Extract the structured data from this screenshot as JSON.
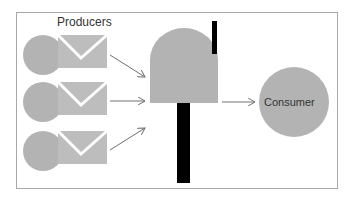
{
  "title": "Producers",
  "consumer": {
    "label": "Consumer"
  },
  "producers": [
    {
      "name": "producer-1"
    },
    {
      "name": "producer-2"
    },
    {
      "name": "producer-3"
    }
  ],
  "colors": {
    "shape_fill": "#b3b3b3",
    "envelope_fill": "#bdbdbd",
    "mailbox_post": "#000000",
    "arrow": "#707070",
    "border": "#a8a8a8"
  }
}
